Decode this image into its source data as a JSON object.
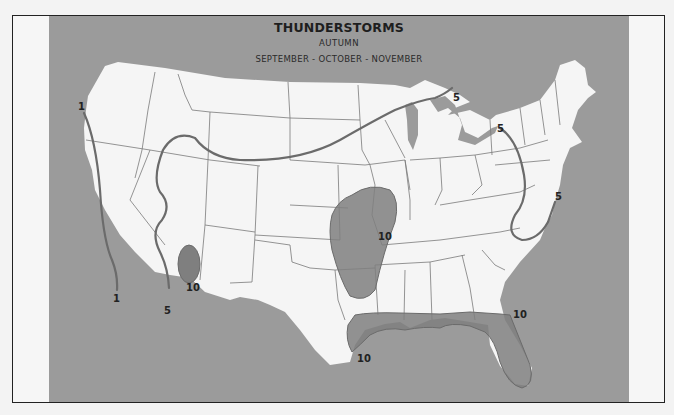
{
  "map": {
    "title": "THUNDERSTORMS",
    "season": "AUTUMN",
    "months": "SEPTEMBER - OCTOBER - NOVEMBER",
    "region": "Contiguous United States",
    "colors": {
      "background": "#f6f6f6",
      "water": "#9b9b9b",
      "land": "#f5f5f5",
      "shaded_area": "#7f7f7f",
      "isoline": "#6b6b6b",
      "state_border": "#7a7a7a"
    },
    "isolines": [
      {
        "value": "1",
        "label_west": "1",
        "label_south": "1",
        "description": "California coast line"
      },
      {
        "value": "5",
        "label_south": "5",
        "label_north": "5",
        "description": "Western/northern line from Arizona through Great Basin to Lake Superior"
      },
      {
        "value": "5",
        "label_north": "5",
        "label_south": "5",
        "description": "Appalachian loop from Lake Ontario to Chesapeake Bay"
      },
      {
        "value": "10",
        "label": "10",
        "description": "Southern Arizona area"
      },
      {
        "value": "10",
        "label": "10",
        "description": "Kansas / Oklahoma / Missouri area"
      },
      {
        "value": "10",
        "label_west": "10",
        "label_east": "10",
        "description": "Gulf Coast and Florida area"
      }
    ],
    "labels": {
      "l1_top": "1",
      "l1_bottom": "1",
      "l5_az": "5",
      "l5_superior": "5",
      "l5_ontario": "5",
      "l5_chesapeake": "5",
      "l10_az": "10",
      "l10_plains": "10",
      "l10_texas": "10",
      "l10_georgia": "10"
    }
  }
}
